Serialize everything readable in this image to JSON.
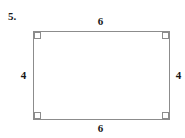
{
  "figure": {
    "problem_number": "5.",
    "shape": "rectangle",
    "stroke_color": "#8c8c8c",
    "label_color": "#161616",
    "background_color": "#ffffff",
    "right_angle_marks": 4,
    "labels": {
      "top": "6",
      "bottom": "6",
      "left": "4",
      "right": "4"
    }
  },
  "chart_data": {
    "type": "diagram",
    "title": "",
    "shape": "rectangle",
    "side_labels": {
      "top": 6,
      "bottom": 6,
      "left": 4,
      "right": 4
    },
    "annotations": [
      "right angle at all four corners"
    ],
    "problem_number": "5."
  }
}
